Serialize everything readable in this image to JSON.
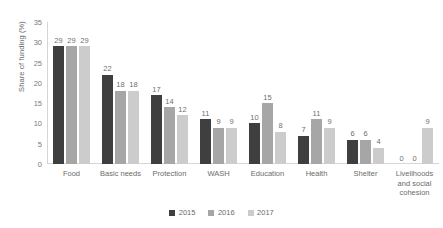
{
  "chart_data": {
    "type": "bar",
    "title": "",
    "xlabel": "",
    "ylabel": "Share of funding (%)",
    "ylim": [
      0,
      35
    ],
    "yticks": [
      "35",
      "30",
      "25",
      "20",
      "15",
      "10",
      "5",
      "0"
    ],
    "grid": false,
    "legend_position": "bottom",
    "categories": [
      "Food",
      "Basic needs",
      "Protection",
      "WASH",
      "Education",
      "Health",
      "Shelter",
      "Livelihoods and social cohesion"
    ],
    "series": [
      {
        "name": "2015",
        "color": "#3f3f3f",
        "values": [
          29,
          22,
          17,
          11,
          10,
          7,
          6,
          0
        ]
      },
      {
        "name": "2016",
        "color": "#a6a6a6",
        "values": [
          29,
          18,
          14,
          9,
          15,
          11,
          6,
          0
        ]
      },
      {
        "name": "2017",
        "color": "#cccccc",
        "values": [
          29,
          18,
          12,
          9,
          8,
          9,
          4,
          9
        ]
      }
    ]
  }
}
